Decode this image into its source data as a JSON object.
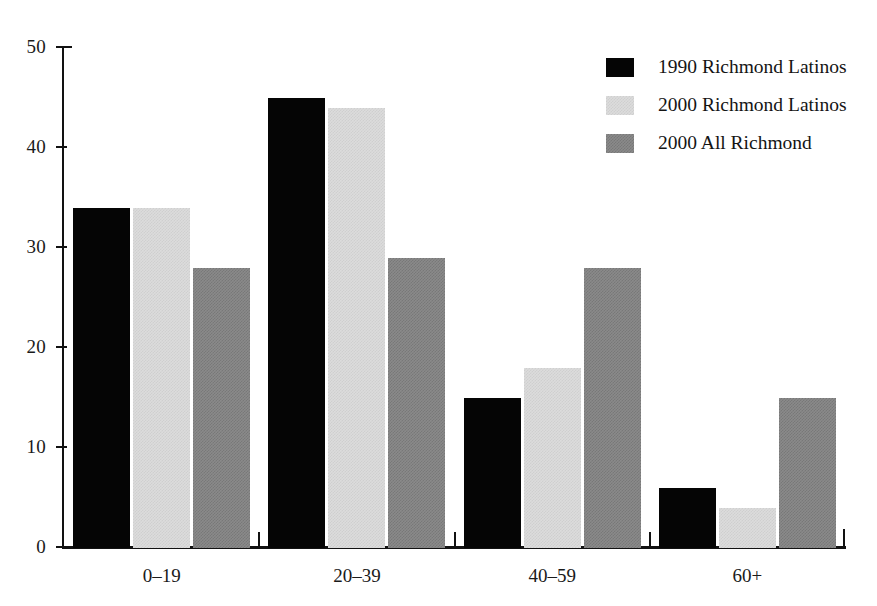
{
  "chart_data": {
    "type": "bar",
    "title": "",
    "subtitle": "",
    "xlabel": "",
    "ylabel": "",
    "categories": [
      "0–19",
      "20–39",
      "40–59",
      "60+"
    ],
    "series": [
      {
        "name": "1990 Richmond Latinos",
        "color": "#050505",
        "values": [
          34,
          45,
          15,
          6
        ]
      },
      {
        "name": "2000 Richmond Latinos",
        "color": "#dcdcdc",
        "values": [
          34,
          44,
          18,
          4
        ]
      },
      {
        "name": "2000 All Richmond",
        "color": "#8a8a8a",
        "values": [
          28,
          29,
          28,
          15
        ]
      }
    ],
    "ylim": [
      0,
      50
    ],
    "yticks": [
      0,
      10,
      20,
      30,
      40,
      50
    ],
    "ytick_labels": [
      "0",
      "10",
      "20",
      "30",
      "40",
      "50"
    ],
    "grid": false,
    "legend_position": "top-right"
  },
  "legend": {
    "items": [
      {
        "label": "1990 Richmond Latinos"
      },
      {
        "label": "2000 Richmond Latinos"
      },
      {
        "label": "2000 All Richmond"
      }
    ]
  },
  "axes": {
    "y_labels": [
      "50",
      "40",
      "30",
      "20",
      "10",
      "0"
    ],
    "x_labels": [
      "0–19",
      "20–39",
      "40–59",
      "60+"
    ]
  }
}
